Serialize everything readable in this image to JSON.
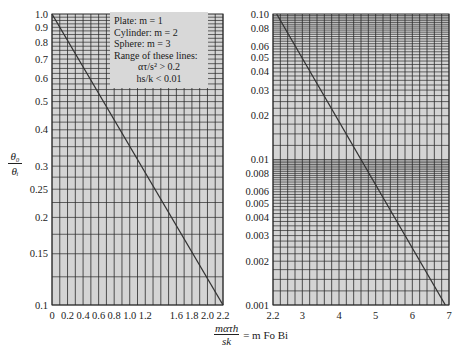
{
  "chart_data": [
    {
      "type": "line",
      "panel": "left",
      "xscale": "linear",
      "yscale": "log",
      "xlim": [
        0,
        2.2
      ],
      "ylim": [
        0.1,
        1.0
      ],
      "xticks": [
        "0",
        "0.2",
        "0.4",
        "0.6",
        "0.8",
        "1.0",
        "1.2",
        "1.6",
        "1.8",
        "2.0",
        "2.2"
      ],
      "xtick_values": [
        0,
        0.2,
        0.4,
        0.6,
        0.8,
        1.0,
        1.2,
        1.6,
        1.8,
        2.0,
        2.2
      ],
      "yticks": [
        "1.0",
        "0.9",
        "0.8",
        "0.7",
        "0.6",
        "0.5",
        "0.4",
        "0.3",
        "0.25",
        "0.2",
        "0.15",
        "0.1"
      ],
      "ytick_values": [
        1.0,
        0.9,
        0.8,
        0.7,
        0.6,
        0.5,
        0.4,
        0.3,
        0.25,
        0.2,
        0.15,
        0.1
      ],
      "grid": true,
      "series": [
        {
          "name": "θ0/θi = exp(-m Fo Bi)",
          "x": [
            0,
            2.2
          ],
          "y": [
            1.0,
            0.1
          ]
        }
      ]
    },
    {
      "type": "line",
      "panel": "right",
      "xscale": "linear",
      "yscale": "log",
      "xlim": [
        2.2,
        7
      ],
      "ylim": [
        0.001,
        0.1
      ],
      "xticks": [
        "2.2",
        "3",
        "4",
        "5",
        "6",
        "7"
      ],
      "xtick_values": [
        2.2,
        3,
        4,
        5,
        6,
        7
      ],
      "yticks": [
        "0.10",
        "0.08",
        "0.06",
        "0.05",
        "0.04",
        "0.03",
        "0.02",
        "0.01",
        "0.008",
        "0.006",
        "0.005",
        "0.004",
        "0.003",
        "0.002",
        "0.001"
      ],
      "ytick_values": [
        0.1,
        0.08,
        0.06,
        0.05,
        0.04,
        0.03,
        0.02,
        0.01,
        0.008,
        0.006,
        0.005,
        0.004,
        0.003,
        0.002,
        0.001
      ],
      "grid": true,
      "series": [
        {
          "name": "θ0/θi = exp(-m Fo Bi)",
          "x": [
            2.3,
            6.9
          ],
          "y": [
            0.1,
            0.001
          ]
        }
      ]
    }
  ],
  "legend": {
    "lines": [
      "Plate: m = 1",
      "Cylinder: m = 2",
      "Sphere: m = 3",
      "Range of these lines:",
      "ατ/s² > 0.2",
      "hs/k < 0.01"
    ]
  },
  "ylabel": {
    "num": "θ₀",
    "den": "θᵢ"
  },
  "xlabel": {
    "num": "mατh",
    "den": "sk",
    "rest": "= m Fo Bi"
  },
  "colors": {
    "plot_bg": "#d4d4d4",
    "grid": "#2a2a2a",
    "line": "#333333"
  }
}
